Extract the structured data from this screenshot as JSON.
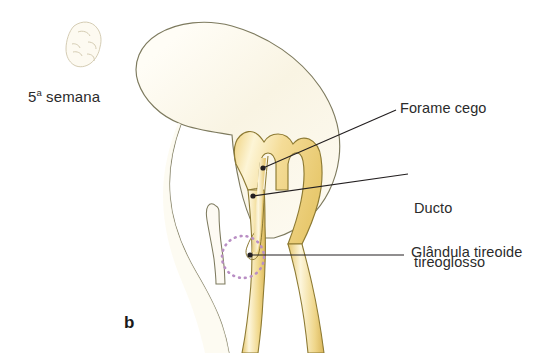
{
  "figure": {
    "panel_letter": "b",
    "stage_label_number": "5",
    "stage_label_ordinal": "a",
    "stage_label_text": " semana",
    "background_color": "#ffffff"
  },
  "labels": [
    {
      "id": "forame-cego",
      "text": "Forame cego"
    },
    {
      "id": "ducto-tireoglosso-line1",
      "text": "Ducto"
    },
    {
      "id": "ducto-tireoglosso-line2",
      "text": "tireoglosso"
    },
    {
      "id": "glandula-tireoide",
      "text": "Glândula tireoide"
    }
  ],
  "colors": {
    "head_fill": "#fbf7ea",
    "head_outline": "#7d7a5e",
    "tongue_fill": "#f6e3a4",
    "tongue_highlight": "#fdf6da",
    "tongue_outline": "#8d7a33",
    "duct_fill": "#f3dd99",
    "thyroid_circle": "#b98ec4",
    "leader_line": "#231f20",
    "label_text": "#2b2b2b",
    "embryo_sketch": "#cfc7ad"
  },
  "annotations": {
    "thyroid_marker_shape": "dotted-circle",
    "embryo_icon": "embryo-sketch-icon"
  }
}
